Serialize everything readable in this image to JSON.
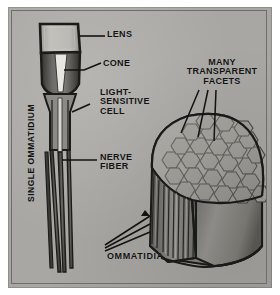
{
  "figure": {
    "kind": "scientific-illustration",
    "palette": {
      "plate_background": "#a8a7a3",
      "border": "#6f6e6a",
      "ink": "#121212",
      "lens_fill": "#b9b8b3",
      "cone_dark": "#4a4a48",
      "cone_light": "#e6e5e0",
      "pigment_mid": "#7b7a76",
      "dome_light": "#b5b4af",
      "dome_mid": "#8d8c88",
      "dome_dark": "#5d5c59",
      "facet_stroke": "#3a3a38",
      "side_wall": "#7e7d79"
    }
  },
  "labels": {
    "lens": "LENS",
    "cone": "CONE",
    "light_sensitive_cell": "LIGHT-\nSENSITIVE\nCELL",
    "nerve_fiber": "NERVE\nFIBER",
    "many_transparent_facets": "MANY\nTRANSPARENT\nFACETS",
    "ommatidia": "OMMATIDIA",
    "single_ommatidium": "SINGLE OMMATIDIUM"
  },
  "diagram": {
    "left_panel": {
      "name": "single ommatidium cross-section",
      "parts": [
        "lens",
        "cone",
        "light-sensitive cell",
        "nerve fiber"
      ]
    },
    "right_panel": {
      "name": "cutaway compound eye dome",
      "parts": [
        "many transparent facets",
        "ommatidia"
      ],
      "facet_shape": "hexagonal"
    }
  }
}
